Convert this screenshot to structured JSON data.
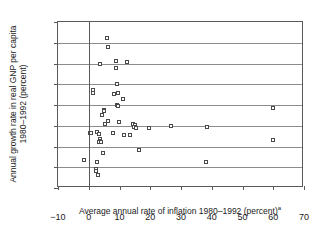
{
  "chart_data": {
    "type": "scatter",
    "title": "",
    "xlabel": "Average annual rate of inflation 1980–1992 (percent)",
    "xlabel_superscript": "a",
    "ylabel_line1": "Annual growth rate in real GNP per capita",
    "ylabel_line2": "1980–1992 (percent)",
    "xlim": [
      -10,
      70
    ],
    "ylim": [
      -6,
      10
    ],
    "xticks": [
      -10,
      0,
      10,
      20,
      30,
      40,
      50,
      60,
      70
    ],
    "yticks": [
      -6,
      -4,
      -2,
      0,
      2,
      4,
      6,
      8,
      10
    ],
    "xtick_labels": [
      "−10",
      "0",
      "10",
      "20",
      "30",
      "40",
      "50",
      "60",
      "70"
    ],
    "ytick_labels": [
      "−6",
      "−4",
      "−2",
      "0",
      "2",
      "4",
      "6",
      "8",
      "10"
    ],
    "grid": "horizontal",
    "grid_values": [
      -4,
      -2,
      0,
      2,
      4,
      6,
      8
    ],
    "zero_line_x": 0,
    "legend": "none",
    "marker": "open-square",
    "marker_color": "#4a4a4a",
    "points": [
      {
        "x": 6.0,
        "y": 8.5
      },
      {
        "x": 6.2,
        "y": 7.6
      },
      {
        "x": 3.6,
        "y": 6.0
      },
      {
        "x": 9.0,
        "y": 6.2
      },
      {
        "x": 9.0,
        "y": 5.6
      },
      {
        "x": 12.6,
        "y": 6.1
      },
      {
        "x": 1.4,
        "y": 3.4
      },
      {
        "x": 1.5,
        "y": 3.2
      },
      {
        "x": 9.3,
        "y": 4.0
      },
      {
        "x": 8.2,
        "y": 3.1
      },
      {
        "x": 9.6,
        "y": 3.2
      },
      {
        "x": 11.0,
        "y": 2.6
      },
      {
        "x": 9.2,
        "y": 2.0
      },
      {
        "x": 9.5,
        "y": 1.9
      },
      {
        "x": 59.8,
        "y": 1.7
      },
      {
        "x": 5.0,
        "y": 1.5
      },
      {
        "x": 5.1,
        "y": 1.4
      },
      {
        "x": 4.3,
        "y": 1.0
      },
      {
        "x": 6.4,
        "y": 0.5
      },
      {
        "x": 9.7,
        "y": 0.4
      },
      {
        "x": 5.2,
        "y": 0.2
      },
      {
        "x": 14.4,
        "y": 0.2
      },
      {
        "x": 14.9,
        "y": 0.1
      },
      {
        "x": 14.7,
        "y": -0.1
      },
      {
        "x": 15.4,
        "y": -0.2
      },
      {
        "x": 19.6,
        "y": -0.2
      },
      {
        "x": 26.7,
        "y": 0.0
      },
      {
        "x": 38.4,
        "y": -0.1
      },
      {
        "x": 0.3,
        "y": -0.7
      },
      {
        "x": 0.8,
        "y": -0.7
      },
      {
        "x": 2.6,
        "y": -0.6
      },
      {
        "x": 3.3,
        "y": -0.8
      },
      {
        "x": 8.0,
        "y": -0.7
      },
      {
        "x": 11.6,
        "y": -0.9
      },
      {
        "x": 13.4,
        "y": -0.9
      },
      {
        "x": 3.5,
        "y": -1.3
      },
      {
        "x": 3.6,
        "y": -1.5
      },
      {
        "x": 3.2,
        "y": -1.6
      },
      {
        "x": 3.9,
        "y": -1.6
      },
      {
        "x": 59.9,
        "y": -1.4
      },
      {
        "x": 4.6,
        "y": -2.6
      },
      {
        "x": 16.5,
        "y": -2.3
      },
      {
        "x": -1.6,
        "y": -3.3
      },
      {
        "x": 2.7,
        "y": -3.5
      },
      {
        "x": 38.2,
        "y": -3.5
      },
      {
        "x": 2.2,
        "y": -4.2
      },
      {
        "x": 2.3,
        "y": -4.4
      },
      {
        "x": 3.0,
        "y": -4.7
      }
    ]
  }
}
